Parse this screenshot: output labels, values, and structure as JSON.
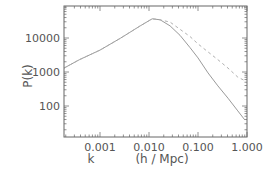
{
  "chart_data": {
    "type": "line",
    "title": "",
    "xlabel": "k",
    "xlabel_units": "(h / Mpc)",
    "ylabel": "P(k)",
    "xscale": "log",
    "yscale": "log",
    "xlim": [
      0.00018,
      1.0
    ],
    "ylim": [
      12,
      100000
    ],
    "grid": false,
    "legend": null,
    "x_ticks": [
      {
        "value": 0.001,
        "label": "0.001"
      },
      {
        "value": 0.01,
        "label": "0.010"
      },
      {
        "value": 0.1,
        "label": "0.100"
      },
      {
        "value": 1.0,
        "label": "1.000"
      }
    ],
    "y_ticks": [
      {
        "value": 100,
        "label": "100"
      },
      {
        "value": 1000,
        "label": "1000"
      },
      {
        "value": 10000,
        "label": "10000"
      }
    ],
    "series": [
      {
        "name": "solid",
        "style": "solid",
        "color": "#9a9a9a",
        "x": [
          0.00018,
          0.00038,
          0.001,
          0.0026,
          0.0066,
          0.0116,
          0.0169,
          0.027,
          0.043,
          0.069,
          0.1,
          0.16,
          0.255,
          0.41,
          0.65,
          0.9
        ],
        "y": [
          1300,
          2300,
          4400,
          9800,
          22700,
          36700,
          34200,
          22700,
          12000,
          5200,
          2600,
          940,
          390,
          170,
          72,
          39
        ]
      },
      {
        "name": "dashed",
        "style": "dashed",
        "color": "#b0b0b0",
        "x": [
          0.0116,
          0.0158,
          0.027,
          0.043,
          0.069,
          0.1,
          0.16,
          0.255,
          0.41,
          0.65,
          0.9
        ],
        "y": [
          36700,
          35000,
          29400,
          18000,
          11000,
          6700,
          3900,
          2300,
          1300,
          710,
          560
        ]
      }
    ]
  }
}
